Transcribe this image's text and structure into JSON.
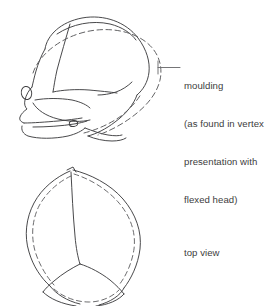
{
  "figure": {
    "background_color": "#ffffff",
    "stroke_color": "#3f3f41",
    "dashed_stroke_color": "#5a5a5c"
  },
  "annotations": {
    "moulding": {
      "lines": [
        "moulding",
        "(as found in vertex",
        "presentation with",
        "flexed head)"
      ],
      "leader_label": "leader-line-to-skull"
    },
    "top_view": {
      "lines": [
        "top view"
      ]
    }
  },
  "views": {
    "lateral": {
      "name": "lateral-view-skull",
      "description": "Side view of fetal skull with dashed moulded outline"
    },
    "superior": {
      "name": "top-view-skull",
      "description": "Top view of fetal skull with dashed moulded outline"
    }
  }
}
